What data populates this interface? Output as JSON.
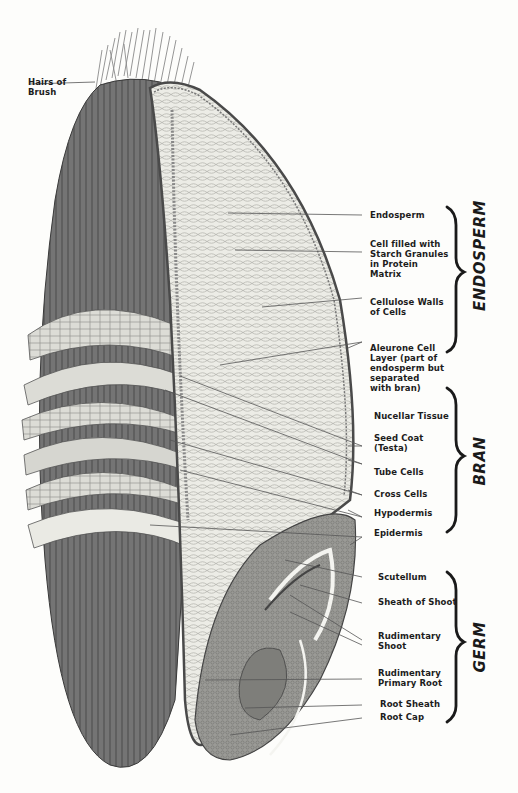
{
  "diagram": {
    "top_label": {
      "text": "Hairs of\nBrush"
    },
    "labels": [
      {
        "id": "endosperm",
        "text": "Endosperm"
      },
      {
        "id": "starch-cell",
        "text": "Cell filled with\nStarch Granules\nin Protein\nMatrix"
      },
      {
        "id": "cellulose-walls",
        "text": "Cellulose Walls\nof Cells"
      },
      {
        "id": "aleurone",
        "text": "Aleurone Cell\nLayer (part of\nendosperm but\nseparated\nwith bran)"
      },
      {
        "id": "nucellar",
        "text": "Nucellar Tissue"
      },
      {
        "id": "seed-coat",
        "text": "Seed Coat\n(Testa)"
      },
      {
        "id": "tube-cells",
        "text": "Tube Cells"
      },
      {
        "id": "cross-cells",
        "text": "Cross Cells"
      },
      {
        "id": "hypodermis",
        "text": "Hypodermis"
      },
      {
        "id": "epidermis",
        "text": "Epidermis"
      },
      {
        "id": "scutellum",
        "text": "Scutellum"
      },
      {
        "id": "sheath-shoot",
        "text": "Sheath of Shoot"
      },
      {
        "id": "rud-shoot",
        "text": "Rudimentary\nShoot"
      },
      {
        "id": "rud-root",
        "text": "Rudimentary\nPrimary Root"
      },
      {
        "id": "root-sheath",
        "text": "Root Sheath"
      },
      {
        "id": "root-cap",
        "text": "Root Cap"
      }
    ],
    "groups": [
      {
        "id": "endosperm-group",
        "text": "ENDOSPERM"
      },
      {
        "id": "bran-group",
        "text": "BRAN"
      },
      {
        "id": "germ-group",
        "text": "GERM"
      }
    ],
    "colors": {
      "ink": "#1c1c1c",
      "bran_dark": "#6e6e6e",
      "endosperm": "#ededE8",
      "paper": "#fdfdfb"
    }
  }
}
